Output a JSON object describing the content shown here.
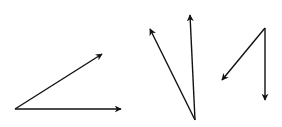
{
  "diagram": {
    "stroke_color": "#111111",
    "background": "#ffffff",
    "groups": [
      {
        "name": "vector-pair-1",
        "origin": [
          15,
          109
        ],
        "arrows": [
          {
            "name": "vector-up-right",
            "tip": [
              102,
              54
            ]
          },
          {
            "name": "vector-right",
            "tip": [
              121,
              109
            ]
          }
        ]
      },
      {
        "name": "vector-pair-2",
        "origin": [
          195,
          120
        ],
        "arrows": [
          {
            "name": "vector-up-left",
            "tip": [
              150,
              29
            ]
          },
          {
            "name": "vector-up",
            "tip": [
              190,
              15
            ]
          }
        ]
      },
      {
        "name": "vector-pair-3",
        "origin": [
          265,
          28
        ],
        "arrows": [
          {
            "name": "vector-down-left",
            "tip": [
              222,
              80
            ]
          },
          {
            "name": "vector-down",
            "tip": [
              265,
              100
            ]
          }
        ]
      }
    ]
  }
}
